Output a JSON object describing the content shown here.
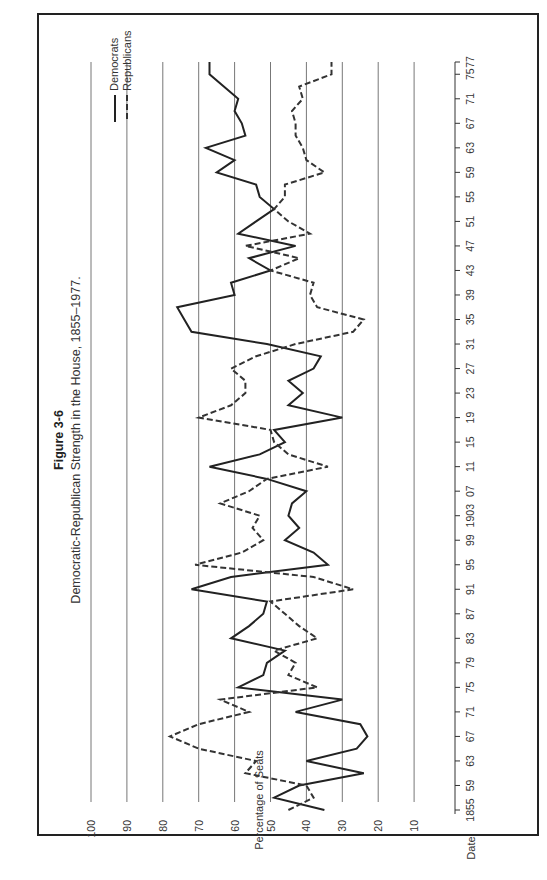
{
  "chart_data": {
    "type": "line",
    "orientation": "rotated-90-ccw",
    "title": "Figure 3-6",
    "subtitle": "Democratic-Republican Strength in the House, 1855–1977.",
    "xlabel": "Date",
    "ylabel": "Percentage of Seats",
    "ylim": [
      0,
      100
    ],
    "xlim": [
      1855,
      1977
    ],
    "grid": true,
    "legend_position": "top-right",
    "y_ticks": [
      "10",
      "20",
      "30",
      "40",
      "50",
      "60",
      "70",
      "80",
      "90",
      "100"
    ],
    "x_tick_labels": [
      "1855",
      "59",
      "63",
      "67",
      "71",
      "75",
      "79",
      "83",
      "87",
      "91",
      "95",
      "99",
      "1903",
      "07",
      "11",
      "15",
      "19",
      "23",
      "27",
      "31",
      "35",
      "39",
      "43",
      "47",
      "51",
      "55",
      "59",
      "63",
      "67",
      "71",
      "75",
      "77"
    ],
    "x_tick_years": [
      1855,
      1859,
      1863,
      1867,
      1871,
      1875,
      1879,
      1883,
      1887,
      1891,
      1895,
      1899,
      1903,
      1907,
      1911,
      1915,
      1919,
      1923,
      1927,
      1931,
      1935,
      1939,
      1943,
      1947,
      1951,
      1955,
      1959,
      1963,
      1967,
      1971,
      1975,
      1977
    ],
    "x": [
      1855,
      1857,
      1859,
      1861,
      1863,
      1865,
      1867,
      1869,
      1871,
      1873,
      1875,
      1877,
      1879,
      1881,
      1883,
      1885,
      1887,
      1889,
      1891,
      1893,
      1895,
      1897,
      1899,
      1901,
      1903,
      1905,
      1907,
      1909,
      1911,
      1913,
      1915,
      1917,
      1919,
      1921,
      1923,
      1925,
      1927,
      1929,
      1931,
      1933,
      1935,
      1937,
      1939,
      1941,
      1943,
      1945,
      1947,
      1949,
      1951,
      1953,
      1955,
      1957,
      1959,
      1961,
      1963,
      1965,
      1967,
      1969,
      1971,
      1973,
      1975,
      1977
    ],
    "series": [
      {
        "name": "Democrats",
        "style": "solid",
        "values": [
          35,
          49,
          42,
          24,
          40,
          26,
          23,
          25,
          43,
          30,
          59,
          52,
          51,
          46,
          61,
          56,
          52,
          51,
          72,
          61,
          34,
          38,
          46,
          42,
          45,
          44,
          40,
          51,
          67,
          53,
          46,
          49,
          30,
          45,
          41,
          45,
          38,
          36,
          51,
          72,
          74,
          76,
          60,
          61,
          50,
          56,
          43,
          59,
          54,
          49,
          53,
          54,
          65,
          60,
          68,
          57,
          58,
          60,
          59,
          63,
          67,
          67
        ]
      },
      {
        "name": "Republicans",
        "style": "dashed",
        "values": [
          45,
          38,
          40,
          57,
          54,
          70,
          78,
          70,
          56,
          64,
          37,
          45,
          43,
          49,
          37,
          42,
          46,
          50,
          27,
          38,
          71,
          58,
          52,
          55,
          53,
          64,
          56,
          51,
          34,
          45,
          49,
          50,
          70,
          61,
          57,
          57,
          61,
          54,
          43,
          27,
          24,
          37,
          39,
          38,
          50,
          42,
          57,
          39,
          45,
          49,
          46,
          46,
          35,
          40,
          41,
          43,
          43,
          44,
          41,
          42,
          33,
          33
        ]
      }
    ]
  },
  "legend": {
    "items": [
      {
        "label": "Democrats",
        "style": "solid"
      },
      {
        "label": "Republicans",
        "style": "dashed"
      }
    ]
  }
}
